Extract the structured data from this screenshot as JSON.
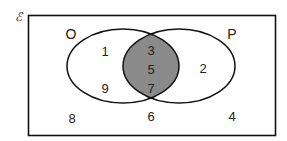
{
  "diagram": {
    "type": "venn",
    "universal_symbol": "ℰ",
    "sets": [
      {
        "name": "O",
        "label": "O"
      },
      {
        "name": "P",
        "label": "P"
      }
    ],
    "regions": {
      "only_O": [
        "1",
        "9"
      ],
      "intersection": [
        "3",
        "5",
        "7"
      ],
      "only_P": [
        "2"
      ],
      "outside": [
        "8",
        "6",
        "4"
      ]
    },
    "shaded_region": "intersection",
    "colors": {
      "shade": "#8a8a8a",
      "stroke": "#111111",
      "background": "#ffffff"
    }
  }
}
